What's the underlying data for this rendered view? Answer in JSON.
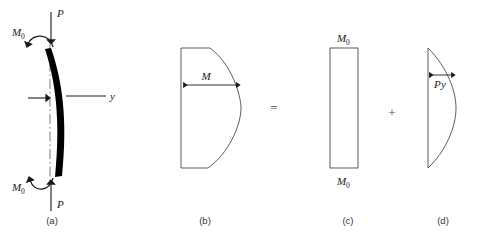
{
  "figure": {
    "background_color": "#ffffff",
    "beam_color": "#000000",
    "outline_color": "#4a4a4a",
    "operators": {
      "equals": "=",
      "plus": "+"
    },
    "panels": [
      {
        "id": "a",
        "caption": "(a)",
        "kind": "free-body-diagram",
        "labels": {
          "load_top": "P",
          "load_bottom": "P",
          "moment_top_base": "M",
          "moment_top_sub": "0",
          "moment_bottom_base": "M",
          "moment_bottom_sub": "0",
          "deflection_axis": "y"
        }
      },
      {
        "id": "b",
        "caption": "(b)",
        "kind": "total-moment-diagram",
        "labels": {
          "dimension": "M"
        }
      },
      {
        "id": "c",
        "caption": "(c)",
        "kind": "uniform-moment-diagram",
        "labels": {
          "top_base": "M",
          "top_sub": "0",
          "bottom_base": "M",
          "bottom_sub": "0"
        }
      },
      {
        "id": "d",
        "caption": "(d)",
        "kind": "py-moment-diagram",
        "labels": {
          "dimension_base": "P",
          "dimension_italic": "y"
        }
      }
    ]
  }
}
